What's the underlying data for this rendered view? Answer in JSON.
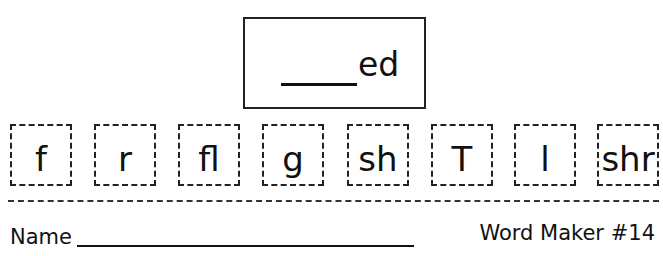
{
  "target": {
    "blank": "____",
    "suffix": "ed"
  },
  "tiles": [
    {
      "text": "f",
      "left": 10
    },
    {
      "text": "r",
      "left": 94
    },
    {
      "text": "fl",
      "left": 178
    },
    {
      "text": "g",
      "left": 262
    },
    {
      "text": "sh",
      "left": 347
    },
    {
      "text": "T",
      "left": 431
    },
    {
      "text": "l",
      "left": 514
    },
    {
      "text": "shr",
      "left": 597
    }
  ],
  "footer": {
    "name_label": "Name",
    "title": "Word Maker #14"
  }
}
